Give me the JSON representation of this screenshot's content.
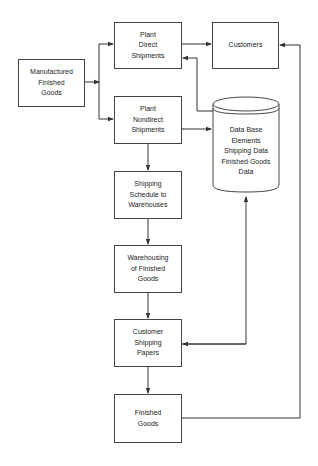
{
  "diagram": {
    "type": "flowchart",
    "nodes": [
      {
        "id": "manufactured",
        "label": "Manufactured\nFinished\nGoods"
      },
      {
        "id": "plant_direct",
        "label": "Plant\nDirect\nShipments"
      },
      {
        "id": "customers",
        "label": "Customers"
      },
      {
        "id": "plant_nondirect",
        "label": "Plant\nNondirect\nShipments"
      },
      {
        "id": "database",
        "label": "Data Base\nElements\nShipping Data\nFinished Goods\nData",
        "shape": "cylinder"
      },
      {
        "id": "shipping_schedule",
        "label": "Shipping\nSchedule to\nWarehouses"
      },
      {
        "id": "warehousing",
        "label": "Warehousing\nof Finished\nGoods"
      },
      {
        "id": "customer_papers",
        "label": "Customer\nShipping\nPapers"
      },
      {
        "id": "finished_goods",
        "label": "Finished\nGoods"
      }
    ],
    "edges": [
      {
        "from": "manufactured",
        "to": "plant_direct"
      },
      {
        "from": "manufactured",
        "to": "plant_nondirect"
      },
      {
        "from": "plant_direct",
        "to": "customers"
      },
      {
        "from": "database",
        "to": "plant_direct",
        "bidirectional": true
      },
      {
        "from": "plant_nondirect",
        "to": "database",
        "bidirectional": true
      },
      {
        "from": "plant_nondirect",
        "to": "shipping_schedule"
      },
      {
        "from": "shipping_schedule",
        "to": "warehousing"
      },
      {
        "from": "warehousing",
        "to": "customer_papers"
      },
      {
        "from": "customer_papers",
        "to": "database",
        "bidirectional": true
      },
      {
        "from": "customer_papers",
        "to": "finished_goods"
      },
      {
        "from": "finished_goods",
        "to": "customers"
      }
    ]
  }
}
